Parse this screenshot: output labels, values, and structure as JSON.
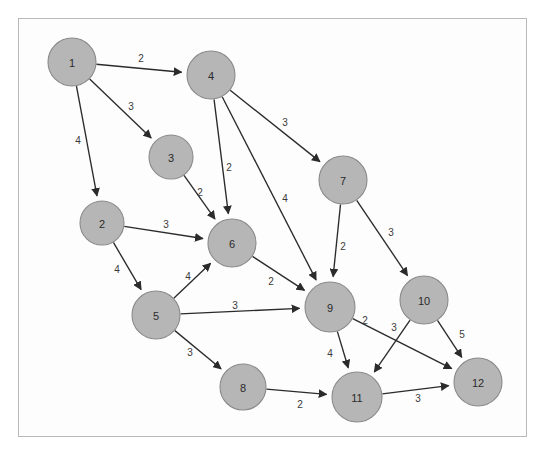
{
  "diagram": {
    "frame": {
      "x": 18,
      "y": 18,
      "width": 509,
      "height": 419,
      "border_color": "#b9b9b9"
    },
    "background_color": "#ffffff",
    "node_fill_color": "#b6b6b6",
    "node_stroke_color": "#8a8a8a",
    "edge_color": "#2b2b2b",
    "label_color": "#2a2a2a",
    "weight_color": "#3a3a3a",
    "node_radius": 23
  },
  "chart_data": {
    "type": "diagram",
    "subtype": "directed-weighted-graph",
    "node_count": 12,
    "edge_count": 17,
    "nodes": [
      {
        "id": "1",
        "label": "1",
        "x": 72,
        "y": 62,
        "r": 24
      },
      {
        "id": "2",
        "label": "2",
        "x": 102,
        "y": 223,
        "r": 22
      },
      {
        "id": "3",
        "label": "3",
        "x": 171,
        "y": 157,
        "r": 22
      },
      {
        "id": "4",
        "label": "4",
        "x": 211,
        "y": 75,
        "r": 24
      },
      {
        "id": "5",
        "label": "5",
        "x": 156,
        "y": 315,
        "r": 24
      },
      {
        "id": "6",
        "label": "6",
        "x": 232,
        "y": 243,
        "r": 24
      },
      {
        "id": "7",
        "label": "7",
        "x": 343,
        "y": 180,
        "r": 24
      },
      {
        "id": "8",
        "label": "8",
        "x": 243,
        "y": 387,
        "r": 23
      },
      {
        "id": "9",
        "label": "9",
        "x": 330,
        "y": 307,
        "r": 25
      },
      {
        "id": "10",
        "label": "10",
        "x": 424,
        "y": 300,
        "r": 24
      },
      {
        "id": "11",
        "label": "11",
        "x": 357,
        "y": 397,
        "r": 25
      },
      {
        "id": "12",
        "label": "12",
        "x": 478,
        "y": 382,
        "r": 24
      }
    ],
    "edges": [
      {
        "from": "1",
        "to": "4",
        "weight": "2",
        "lx": 141,
        "ly": 58
      },
      {
        "from": "1",
        "to": "3",
        "weight": "3",
        "lx": 131,
        "ly": 106
      },
      {
        "from": "1",
        "to": "2",
        "weight": "4",
        "lx": 78,
        "ly": 140
      },
      {
        "from": "4",
        "to": "6",
        "weight": "2",
        "lx": 229,
        "ly": 167
      },
      {
        "from": "4",
        "to": "7",
        "weight": "3",
        "lx": 285,
        "ly": 122
      },
      {
        "from": "4",
        "to": "9",
        "weight": "4",
        "lx": 285,
        "ly": 198
      },
      {
        "from": "3",
        "to": "6",
        "weight": "2",
        "lx": 200,
        "ly": 192
      },
      {
        "from": "2",
        "to": "6",
        "weight": "3",
        "lx": 166,
        "ly": 224
      },
      {
        "from": "2",
        "to": "5",
        "weight": "4",
        "lx": 117,
        "ly": 269
      },
      {
        "from": "5",
        "to": "6",
        "weight": "4",
        "lx": 188,
        "ly": 276
      },
      {
        "from": "5",
        "to": "9",
        "weight": "3",
        "lx": 235,
        "ly": 305
      },
      {
        "from": "5",
        "to": "8",
        "weight": "3",
        "lx": 190,
        "ly": 352
      },
      {
        "from": "6",
        "to": "9",
        "weight": "2",
        "lx": 271,
        "ly": 281
      },
      {
        "from": "7",
        "to": "9",
        "weight": "2",
        "lx": 343,
        "ly": 246
      },
      {
        "from": "7",
        "to": "10",
        "weight": "3",
        "lx": 391,
        "ly": 232
      },
      {
        "from": "9",
        "to": "12",
        "weight": "2",
        "lx": 365,
        "ly": 320
      },
      {
        "from": "9",
        "to": "11",
        "weight": "4",
        "lx": 330,
        "ly": 353
      },
      {
        "from": "10",
        "to": "11",
        "weight": "3",
        "lx": 394,
        "ly": 327
      },
      {
        "from": "10",
        "to": "12",
        "weight": "5",
        "lx": 462,
        "ly": 334
      },
      {
        "from": "8",
        "to": "11",
        "weight": "2",
        "lx": 300,
        "ly": 404
      },
      {
        "from": "11",
        "to": "12",
        "weight": "3",
        "lx": 418,
        "ly": 398
      }
    ]
  }
}
